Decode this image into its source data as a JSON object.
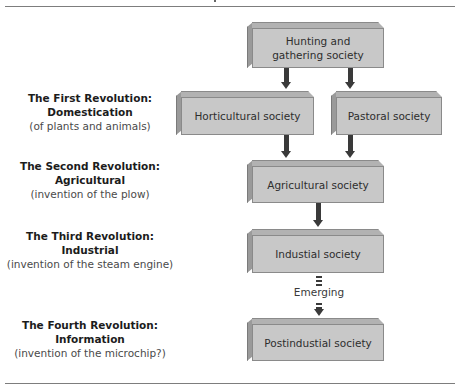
{
  "diagram": {
    "title_rule": true,
    "boxes": {
      "hunting": "Hunting and gathering society",
      "horticultural": "Horticultural society",
      "pastoral": "Pastoral society",
      "agricultural": "Agricultural society",
      "industrial": "Industial society",
      "postindustrial": "Postindustial society"
    },
    "connector_label": "Emerging",
    "revolutions": [
      {
        "title": "The First Revolution:",
        "name": "Domestication",
        "note": "(of plants and animals)"
      },
      {
        "title": "The Second Revolution:",
        "name": "Agricultural",
        "note": "(invention of the plow)"
      },
      {
        "title": "The Third Revolution:",
        "name": "Industrial",
        "note": "(invention of the steam engine)"
      },
      {
        "title": "The Fourth Revolution:",
        "name": "Information",
        "note": "(invention of the microchip?)"
      }
    ],
    "colors": {
      "box_front": "#c8c8c8",
      "box_top": "#b2b2b2",
      "box_side": "#9a9a9a",
      "arrow": "#3a3a3a",
      "rule": "#7d7d7d"
    }
  }
}
